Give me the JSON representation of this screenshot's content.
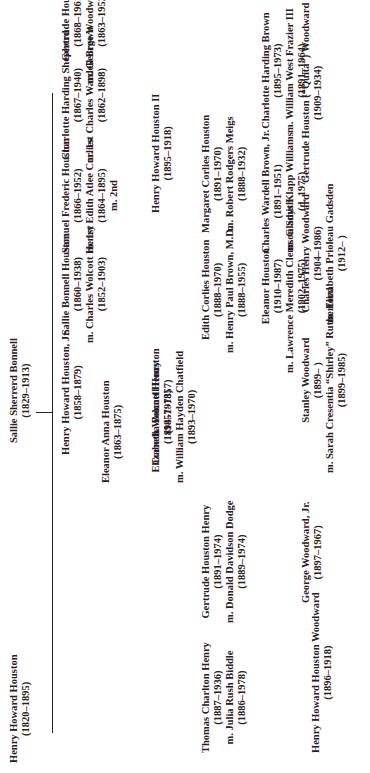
{
  "chart_title": "Houston family genealogy",
  "root": {
    "name": "Sallie Sherrerd Bonnell",
    "dates": "(1829–1913)",
    "spouse": "Henry Howard Houston",
    "spouse_dates": "(1820–1895)"
  },
  "children": [
    {
      "lines": [
        "Henry Howard Houston, Jr.",
        "(1858–1879)"
      ]
    },
    {
      "lines": [
        "Cornelia Bonnell Houston",
        "(1857–1857)"
      ]
    },
    {
      "lines": [
        "Eleanor Anna Houston",
        "(1863–1875)"
      ]
    },
    {
      "lines": [
        "Sallie Bonnell Houston",
        "(1860–1938)",
        "m. Charles Wolcott Henry",
        "(1852–1903)"
      ]
    },
    {
      "lines": [
        "Samuel Frederic Houston",
        "(1866–1952)",
        "m. 1st Edith Atlee Corlies",
        "(1864–1895)",
        "m. 2nd"
      ]
    },
    {
      "lines": [
        "Charlotte Harding Shepherd",
        "(1867–1940)",
        "m. 1st Charles Wardell Brown",
        "(1862–1898)"
      ]
    },
    {
      "lines": [
        "Gertrude Houston",
        "(1868–1961)",
        "m. George Woodward, M.D.",
        "(1863–1952)"
      ]
    }
  ],
  "grandchildren": [
    {
      "lines": [
        "Thomas Charlton Henry",
        "(1887–1936)",
        "m. Julia Rush Biddle",
        "(1886–1978)"
      ]
    },
    {
      "lines": [
        "Gertrude Houston Henry",
        "(1891–1974)",
        "m. Donald Davidson Dodge",
        "(1889–1974)"
      ]
    },
    {
      "lines": [
        "Elizabeth Wolcott Henry",
        "(1894–1973)",
        "m. William Hayden Chatfield",
        "(1893–1970)"
      ]
    },
    {
      "lines": [
        "Edith Corlies Houston",
        "(1888–1970)",
        "m. Henry Paul Brown, M.D.",
        "(1888–1955)"
      ]
    },
    {
      "lines": [
        "Margaret Corlies Houston",
        "(1891–1970)",
        "m. Robert Rodgers Meigs",
        "(1888–1932)"
      ]
    },
    {
      "lines": [
        "Henry Howard Houston II",
        "(1895–1918)"
      ]
    },
    {
      "lines": [
        "Eleanor Houston",
        "(1910–1987)",
        "m. Lawrence Meredith Clemson Smith",
        "(1902–1975)"
      ]
    },
    {
      "lines": [
        "Charles Wardell Brown, Jr.",
        "(1891–1951)",
        "m. Gladys Klapp Williams",
        "(d. 1975)"
      ]
    },
    {
      "lines": [
        "Charlotte Harding Brown",
        "(1895–1973)",
        "m. William West Frazier III",
        "(1891–1964)"
      ]
    },
    {
      "lines": [
        "Henry Howard Houston Woodward",
        "(1896–1918)"
      ]
    },
    {
      "lines": [
        "George Woodward, Jr.",
        "(1897–1967)",
        "m. 1st Asenath Brooks Thompson",
        "m. 2nd Laura Leonard",
        "m. 3rd Harriet Ellison Hirst",
        "(1908–    )"
      ]
    },
    {
      "lines": [
        "Stanley Woodward",
        "(1899–    )",
        "m. Sarah Cresentia “Shirley” Rutherford",
        "(1899–1985)"
      ]
    },
    {
      "lines": [
        "Charles Henry Woodward",
        "(1904–1986)",
        "m. Elizabeth Prioleau Gadsden",
        "(1912–    )"
      ]
    },
    {
      "lines": [
        "Gertrude Houston (“Quita”) Woodward",
        "(1909–1934)"
      ]
    }
  ]
}
